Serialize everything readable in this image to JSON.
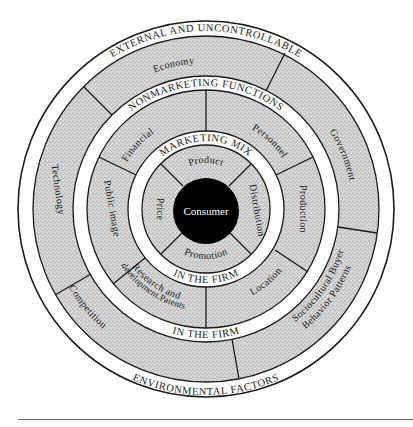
{
  "diagram": {
    "center": {
      "label": "Consumer",
      "color": "#000000"
    },
    "marketing_mix": {
      "top_label": "MARKETING MIX",
      "bottom_label": "IN THE FIRM",
      "segments": [
        "Product",
        "Distribution",
        "Promotion",
        "Price"
      ]
    },
    "nonmarketing_functions": {
      "top_label": "NONMARKETING FUNCTIONS",
      "bottom_label": "IN THE FIRM",
      "segments": [
        "Financial",
        "Personnel",
        "Production",
        "Location",
        "Research and",
        "development.Patents",
        "Public image"
      ]
    },
    "environmental": {
      "top_label": "EXTERNAL AND UNCONTROLLABLE",
      "bottom_label": "ENVIRONMENTAL FACTORS",
      "segments": [
        "Economy",
        "Government",
        "Sociocultural Buyer",
        "Behavior Patterns",
        "Competition",
        "Technology"
      ]
    },
    "colors": {
      "stipple": "#cfcfcf",
      "line": "#1a1a1a",
      "band": "#ffffff"
    }
  }
}
